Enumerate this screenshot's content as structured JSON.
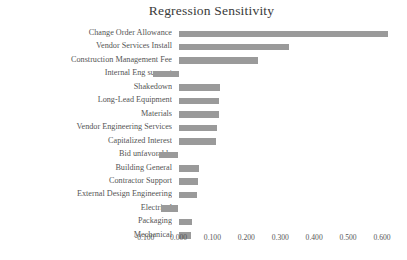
{
  "chart_data": {
    "type": "bar",
    "orientation": "horizontal",
    "title": "Regression Sensitivity",
    "xlabel": "",
    "ylabel": "",
    "grid": false,
    "legend": false,
    "bar_color": "#9a9a9a",
    "text_color": "#555555",
    "xlim": [
      -0.13,
      0.64
    ],
    "xticks": [
      -0.1,
      0.0,
      0.1,
      0.2,
      0.3,
      0.4,
      0.5,
      0.6
    ],
    "xtick_labels": [
      "-0.100",
      "0.000",
      "0.100",
      "0.200",
      "0.300",
      "0.400",
      "0.500",
      "0.600"
    ],
    "categories": [
      "Change Order Allowance",
      "Vendor Services Install",
      "Construction Management Fee",
      "Internal Eng support",
      "Shakedown",
      "Long-Lead Equipment",
      "Materials",
      "Vendor Engineering Services",
      "Capitalized Interest",
      "Bid unfavorable",
      "Building General",
      "Contractor Support",
      "External Design Engineering",
      "Electrical",
      "Packaging",
      "Mechanical"
    ],
    "values": [
      0.617,
      0.326,
      0.234,
      -0.075,
      0.122,
      0.12,
      0.118,
      0.114,
      0.11,
      -0.057,
      0.06,
      0.058,
      0.055,
      -0.052,
      0.04,
      0.036
    ]
  }
}
